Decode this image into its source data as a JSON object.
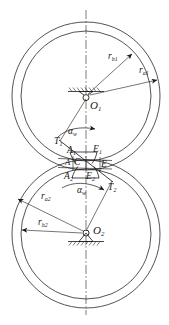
{
  "figure": {
    "type": "engineering-line-drawing",
    "width": 169,
    "height": 325,
    "background_color": "#ffffff",
    "line_color": "#1a1a1a",
    "centerline_color": "#555555"
  },
  "gears": [
    {
      "id": "gear-1",
      "center_label": "O",
      "center_subscript": "1",
      "center_x": 86,
      "center_y": 96,
      "addendum_radius_px": 74,
      "base_radius_px": 65,
      "addendum_label": "r",
      "addendum_subscript": "a1",
      "base_label": "r",
      "base_subscript": "b1"
    },
    {
      "id": "gear-2",
      "center_label": "O",
      "center_subscript": "2",
      "center_x": 86,
      "center_y": 234,
      "addendum_radius_px": 74,
      "base_radius_px": 65,
      "addendum_label": "r",
      "addendum_subscript": "a2",
      "base_label": "r",
      "base_subscript": "b2"
    }
  ],
  "labels": {
    "center_o1": {
      "base": "O",
      "sub": "1"
    },
    "center_o2": {
      "base": "O",
      "sub": "2"
    },
    "radius_b1": {
      "base": "r",
      "sub": "b1"
    },
    "radius_a1": {
      "base": "r",
      "sub": "a1"
    },
    "radius_a2": {
      "base": "r",
      "sub": "a2"
    },
    "radius_b2": {
      "base": "r",
      "sub": "b2"
    },
    "tangent_t1": {
      "base": "T",
      "sub": "1"
    },
    "tangent_t2": {
      "base": "T",
      "sub": "2"
    },
    "point_a1": {
      "base": "A",
      "sub": "1"
    },
    "point_a2": {
      "base": "A",
      "sub": "2"
    },
    "point_e1": {
      "base": "E",
      "sub": "1"
    },
    "point_e2": {
      "base": "E",
      "sub": "2"
    },
    "point_a": {
      "base": "A",
      "sub": ""
    },
    "point_c": {
      "base": "C",
      "sub": ""
    },
    "point_e": {
      "base": "E",
      "sub": ""
    },
    "pressure_angle_upper": {
      "base": "α",
      "sub": "w"
    },
    "pressure_angle_lower": {
      "base": "α",
      "sub": "w"
    }
  },
  "geometry_notes": {
    "pitch_point": "C",
    "line_of_action_start": "A",
    "line_of_action_end": "E",
    "contact_path_label": "A–E",
    "pressure_angle_symbol": "αw",
    "vertical_centerline": true,
    "supports": [
      "O1 fixed pivot with hatching",
      "O2 fixed pivot with hatching"
    ]
  }
}
